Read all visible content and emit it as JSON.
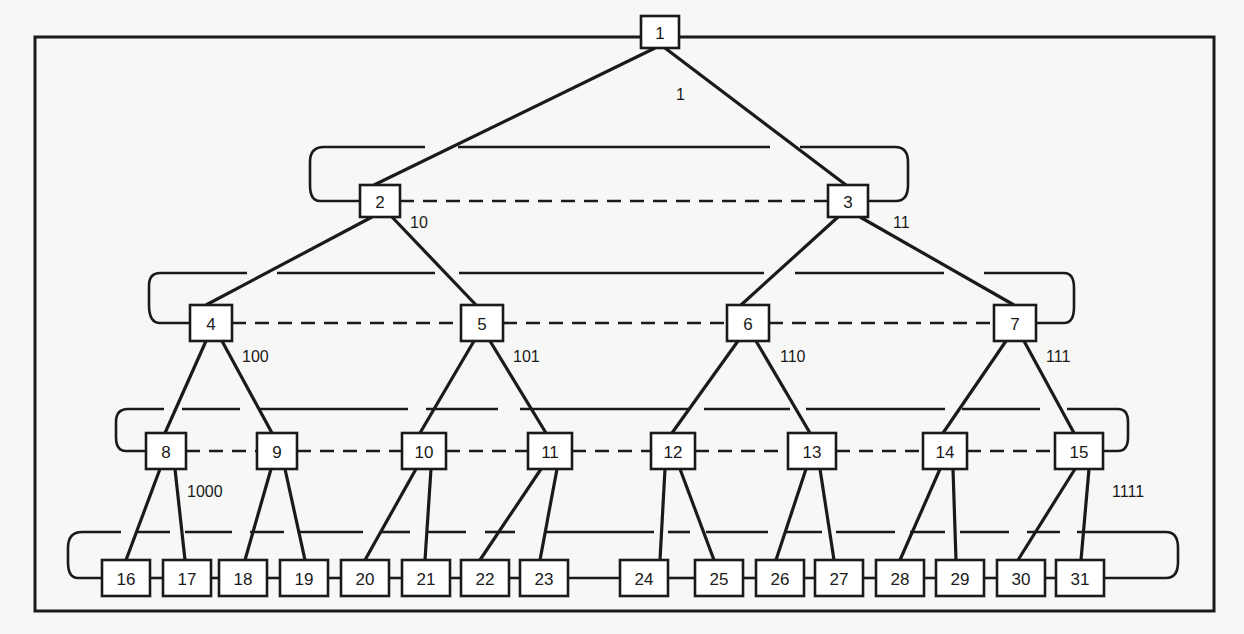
{
  "diagram": {
    "type": "binary-tree-network",
    "colors": {
      "line": "#1a1a1a",
      "node_fill": "#ffffff",
      "background": "#f7f7f5"
    },
    "nodes": [
      {
        "id": "1",
        "x": 641,
        "y": 16,
        "w": 38,
        "h": 32
      },
      {
        "id": "2",
        "x": 360,
        "y": 185,
        "w": 40,
        "h": 32
      },
      {
        "id": "3",
        "x": 828,
        "y": 185,
        "w": 40,
        "h": 32
      },
      {
        "id": "4",
        "x": 190,
        "y": 305,
        "w": 42,
        "h": 36
      },
      {
        "id": "5",
        "x": 461,
        "y": 305,
        "w": 42,
        "h": 36
      },
      {
        "id": "6",
        "x": 727,
        "y": 305,
        "w": 42,
        "h": 36
      },
      {
        "id": "7",
        "x": 994,
        "y": 305,
        "w": 42,
        "h": 36
      },
      {
        "id": "8",
        "x": 146,
        "y": 433,
        "w": 40,
        "h": 36
      },
      {
        "id": "9",
        "x": 257,
        "y": 433,
        "w": 40,
        "h": 36
      },
      {
        "id": "10",
        "x": 402,
        "y": 433,
        "w": 44,
        "h": 36
      },
      {
        "id": "11",
        "x": 528,
        "y": 433,
        "w": 44,
        "h": 36
      },
      {
        "id": "12",
        "x": 651,
        "y": 433,
        "w": 44,
        "h": 36
      },
      {
        "id": "13",
        "x": 788,
        "y": 433,
        "w": 48,
        "h": 36
      },
      {
        "id": "14",
        "x": 923,
        "y": 433,
        "w": 44,
        "h": 36
      },
      {
        "id": "15",
        "x": 1055,
        "y": 433,
        "w": 48,
        "h": 36
      },
      {
        "id": "16",
        "x": 102,
        "y": 560,
        "w": 48,
        "h": 36
      },
      {
        "id": "17",
        "x": 163,
        "y": 560,
        "w": 48,
        "h": 36
      },
      {
        "id": "18",
        "x": 219,
        "y": 560,
        "w": 48,
        "h": 36
      },
      {
        "id": "19",
        "x": 280,
        "y": 560,
        "w": 48,
        "h": 36
      },
      {
        "id": "20",
        "x": 341,
        "y": 560,
        "w": 48,
        "h": 36
      },
      {
        "id": "21",
        "x": 402,
        "y": 560,
        "w": 48,
        "h": 36
      },
      {
        "id": "22",
        "x": 461,
        "y": 560,
        "w": 48,
        "h": 36
      },
      {
        "id": "23",
        "x": 520,
        "y": 560,
        "w": 48,
        "h": 36
      },
      {
        "id": "24",
        "x": 620,
        "y": 560,
        "w": 48,
        "h": 36
      },
      {
        "id": "25",
        "x": 695,
        "y": 560,
        "w": 48,
        "h": 36
      },
      {
        "id": "26",
        "x": 756,
        "y": 560,
        "w": 48,
        "h": 36
      },
      {
        "id": "27",
        "x": 815,
        "y": 560,
        "w": 48,
        "h": 36
      },
      {
        "id": "28",
        "x": 876,
        "y": 560,
        "w": 48,
        "h": 36
      },
      {
        "id": "29",
        "x": 936,
        "y": 560,
        "w": 48,
        "h": 36
      },
      {
        "id": "30",
        "x": 997,
        "y": 560,
        "w": 48,
        "h": 36
      },
      {
        "id": "31",
        "x": 1056,
        "y": 560,
        "w": 48,
        "h": 36
      }
    ],
    "edge_labels": [
      {
        "text": "1",
        "x": 676,
        "y": 100
      },
      {
        "text": "10",
        "x": 410,
        "y": 228
      },
      {
        "text": "11",
        "x": 893,
        "y": 228
      },
      {
        "text": "100",
        "x": 242,
        "y": 362
      },
      {
        "text": "101",
        "x": 513,
        "y": 362
      },
      {
        "text": "110",
        "x": 780,
        "y": 362
      },
      {
        "text": "111",
        "x": 1046,
        "y": 362
      },
      {
        "text": "1000",
        "x": 187,
        "y": 497
      },
      {
        "text": "1111",
        "x": 1112,
        "y": 497
      }
    ]
  }
}
